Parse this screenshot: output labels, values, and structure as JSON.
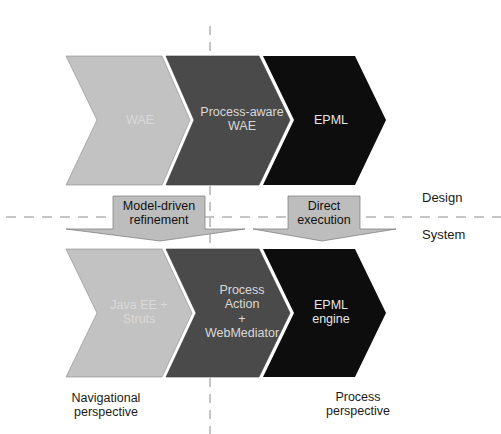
{
  "diagram": {
    "top_row": [
      {
        "label_lines": [
          "WAE"
        ],
        "fill": "#c2c2c2"
      },
      {
        "label_lines": [
          "Process-aware",
          "WAE"
        ],
        "fill": "#4a4a4a"
      },
      {
        "label_lines": [
          "EPML"
        ],
        "fill": "#0d0d0d"
      }
    ],
    "bottom_row": [
      {
        "label_lines": [
          "Java EE +",
          "Struts"
        ],
        "fill": "#c2c2c2"
      },
      {
        "label_lines": [
          "Process",
          "Action",
          "+",
          "WebMediator"
        ],
        "fill": "#4a4a4a"
      },
      {
        "label_lines": [
          "EPML",
          "engine"
        ],
        "fill": "#0d0d0d"
      }
    ],
    "transitions": [
      {
        "label_lines": [
          "Model-driven",
          "refinement"
        ]
      },
      {
        "label_lines": [
          "Direct",
          "execution"
        ]
      }
    ],
    "layers": {
      "upper": "Design",
      "lower": "System"
    },
    "perspectives": {
      "left": [
        "Navigational",
        "perspective"
      ],
      "right": [
        "Process",
        "perspective"
      ]
    },
    "colors": {
      "light": "#c2c2c2",
      "medium": "#4a4a4a",
      "dark": "#0d0d0d",
      "arrow_box": "#bdbdbd",
      "divider": "#8a8a8a"
    }
  }
}
